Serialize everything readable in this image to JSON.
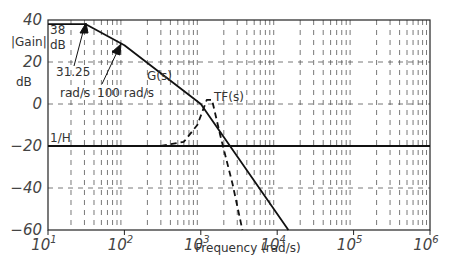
{
  "chart_data": {
    "type": "line",
    "title": "",
    "xlabel": "Frequency (rad/s)",
    "ylabel": "|Gain| dB",
    "xscale": "log",
    "xlim": [
      10,
      1000000
    ],
    "ylim": [
      -60,
      40
    ],
    "x_ticks": [
      "10^1",
      "10^2",
      "10^3",
      "10^4",
      "10^5",
      "10^6"
    ],
    "y_ticks": [
      40,
      20,
      0,
      -20,
      -40,
      -60
    ],
    "grid": true,
    "series": [
      {
        "name": "G(s)",
        "style": "solid",
        "points": [
          [
            10,
            38
          ],
          [
            31.25,
            38
          ],
          [
            100,
            28
          ],
          [
            1000,
            0
          ],
          [
            14000,
            -60
          ]
        ]
      },
      {
        "name": "1/H",
        "style": "solid",
        "points": [
          [
            10,
            -20
          ],
          [
            1000000,
            -20
          ]
        ]
      },
      {
        "name": "TF(s)",
        "style": "dashed",
        "points": [
          [
            300,
            -20
          ],
          [
            600,
            -18
          ],
          [
            900,
            -10
          ],
          [
            1200,
            2
          ],
          [
            1400,
            2
          ],
          [
            1800,
            -15
          ],
          [
            2600,
            -38
          ],
          [
            3500,
            -60
          ]
        ]
      }
    ],
    "annotations": [
      {
        "text": "|Gain|",
        "role": "ylabel-part1"
      },
      {
        "text": "dB",
        "role": "ylabel-part2"
      },
      {
        "text": "38",
        "role": "value-label"
      },
      {
        "text": "dB",
        "role": "value-unit"
      },
      {
        "text": "31.25",
        "role": "corner-1-value"
      },
      {
        "text": "rad/s",
        "role": "corner-1-unit"
      },
      {
        "text": "100 rad/s",
        "role": "corner-2"
      },
      {
        "text": "G(s)",
        "role": "curve-label"
      },
      {
        "text": "TF(s)",
        "role": "curve-label"
      },
      {
        "text": "1/H",
        "role": "curve-label"
      }
    ]
  },
  "labels": {
    "ylabel1": "|Gain|",
    "ylabel2": "dB",
    "val38": "38",
    "val38unit": "dB",
    "corner1": "31.25",
    "corner1unit": "rad/s",
    "corner2": "100 rad/s",
    "g": "G(s)",
    "tf": "TF(s)",
    "h": "1/H",
    "xlabel": "Frequency (rad/s)",
    "y40": "40",
    "y20": "20",
    "y0": "0",
    "ym20": "−20",
    "ym40": "−40",
    "ym60": "−60"
  }
}
